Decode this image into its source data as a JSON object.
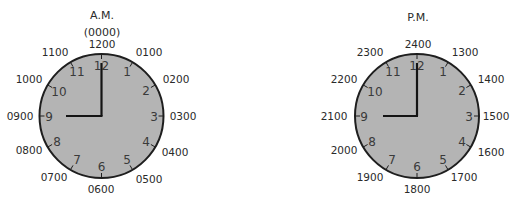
{
  "clocks": {
    "am": {
      "title": "A.M.",
      "subtitle": "(0000)",
      "center": [
        101.5,
        116
      ],
      "radius": 62,
      "hour_hand_end": [
        66,
        116
      ],
      "minute_hand_end": [
        101.5,
        63
      ],
      "outer_labels": {
        "h12": "1200",
        "h1": "0100",
        "h2": "0200",
        "h3": "0300",
        "h4": "0400",
        "h5": "0500",
        "h6": "0600",
        "h7": "0700",
        "h8": "0800",
        "h9": "0900",
        "h10": "1000",
        "h11": "1100"
      }
    },
    "pm": {
      "title": "P.M.",
      "center": [
        417,
        116
      ],
      "radius": 62,
      "hour_hand_end": [
        383,
        116
      ],
      "minute_hand_end": [
        417,
        63
      ],
      "outer_labels": {
        "h12": "2400",
        "h1": "1300",
        "h2": "1400",
        "h3": "1500",
        "h4": "1600",
        "h5": "1700",
        "h6": "1800",
        "h7": "1900",
        "h8": "2000",
        "h9": "2100",
        "h10": "2200",
        "h11": "2300"
      }
    }
  },
  "dial_numerals": {
    "n12": "12",
    "n1": "1",
    "n2": "2",
    "n3": "3",
    "n4": "4",
    "n5": "5",
    "n6": "6",
    "n7": "7",
    "n8": "8",
    "n9": "9",
    "n10": "10",
    "n11": "11"
  },
  "colors": {
    "face": "#b4b4b4",
    "outline": "#1e1e1e",
    "text": "#2a2a2a"
  }
}
